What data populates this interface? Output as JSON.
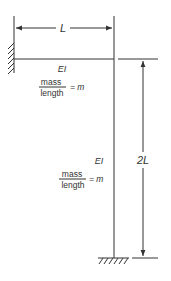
{
  "diagram": {
    "title": "",
    "colors": {
      "line": "#333333",
      "background": "#ffffff"
    },
    "dimensions": {
      "horizontal": {
        "label": "L"
      },
      "vertical": {
        "label": "2L"
      }
    },
    "members": {
      "beam": {
        "stiffness_label": "EI",
        "mass_numerator": "mass",
        "mass_denominator": "length",
        "mass_equals": "= m"
      },
      "column": {
        "stiffness_label": "EI",
        "mass_numerator": "mass",
        "mass_denominator": "length",
        "mass_equals": "= m"
      }
    },
    "supports": {
      "left": "fixed-wall",
      "bottom": "fixed-ground"
    }
  }
}
